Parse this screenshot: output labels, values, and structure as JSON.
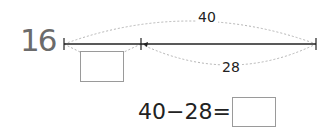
{
  "problem": {
    "number": "16",
    "total_label": "40",
    "part_label": "28",
    "equation": "40−28=",
    "answer": ""
  },
  "colors": {
    "line": "#222222",
    "dashed": "#b5b5b5",
    "number": "#6b6b6b",
    "box_border": "#9a9a9a"
  }
}
